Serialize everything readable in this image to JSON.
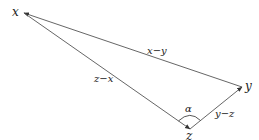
{
  "diagram": {
    "type": "vector-triangle",
    "vertices": [
      {
        "id": "x",
        "label": "x",
        "pos": [
          24,
          13
        ]
      },
      {
        "id": "y",
        "label": "y",
        "pos": [
          242,
          87
        ]
      },
      {
        "id": "z",
        "label": "z",
        "pos": [
          190,
          129
        ]
      }
    ],
    "edges": [
      {
        "from": "y",
        "to": "x",
        "label": "x−y"
      },
      {
        "from": "z",
        "to": "y",
        "label": "y−z"
      },
      {
        "from": "x",
        "to": "z",
        "label": "z−x"
      }
    ],
    "angle": {
      "at": "z",
      "label": "α"
    },
    "colors": {
      "line": "#555555",
      "text": "#222222",
      "background": "#ffffff"
    }
  },
  "labels": {
    "x": "x",
    "y": "y",
    "z": "z",
    "x_minus_y": "x−y",
    "y_minus_z": "y−z",
    "z_minus_x": "z−x",
    "alpha": "α"
  }
}
